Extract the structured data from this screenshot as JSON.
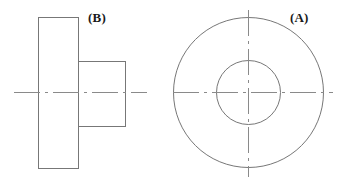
{
  "drawing": {
    "title": "Stepped cylindrical part — two orthographic views",
    "background_color": "#ffffff",
    "line_color": "#777777",
    "centerline_color": "#888888",
    "label_color": "#1a1a1a",
    "line_width": 1,
    "canvas": {
      "width": 339,
      "height": 183
    }
  },
  "views": {
    "front": {
      "label": "(A)",
      "label_x": 290,
      "label_y": 11,
      "description": "front view with two concentric circles",
      "center": {
        "x": 248,
        "y": 92
      },
      "circles": [
        {
          "name": "outer-circle",
          "radius": 75
        },
        {
          "name": "inner-circle",
          "radius": 32
        }
      ],
      "centerlines": {
        "horizontal": {
          "x1": 173,
          "y1": 92,
          "x2": 333,
          "y2": 92
        },
        "vertical": {
          "x1": 248,
          "y1": 10,
          "x2": 248,
          "y2": 177
        }
      }
    },
    "side": {
      "label": "(B)",
      "label_x": 88,
      "label_y": 11,
      "description": "side view with flange rectangle and boss step rectangle",
      "rectangles": [
        {
          "name": "flange-rect",
          "x": 38,
          "y": 17,
          "width": 40,
          "height": 151
        },
        {
          "name": "boss-rect",
          "x": 78,
          "y": 61,
          "width": 47,
          "height": 65
        }
      ],
      "centerlines": {
        "horizontal": {
          "x1": 14,
          "y1": 92,
          "x2": 147,
          "y2": 92
        }
      }
    }
  }
}
